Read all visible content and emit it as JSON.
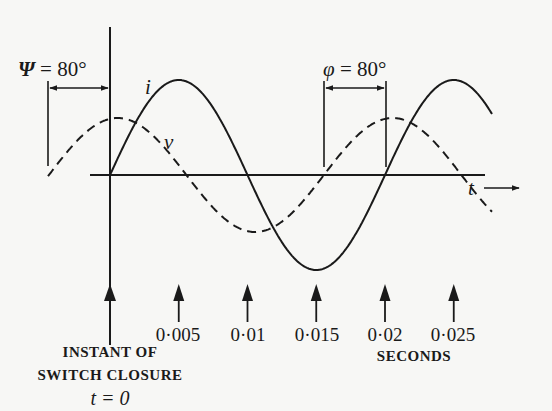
{
  "figure": {
    "psi_label": {
      "symbol": "Ψ",
      "text": " = 80°"
    },
    "phi_label": {
      "symbol": "φ",
      "text": " = 80°"
    },
    "current_label": "i",
    "voltage_label": "v",
    "time_axis_label": "t",
    "origin_caption": [
      "INSTANT OF",
      "SWITCH CLOSURE",
      "t = 0"
    ],
    "time_units": "SECONDS",
    "time_ticks": [
      "0·005",
      "0·01",
      "0·015",
      "0·02",
      "0·025"
    ]
  },
  "chart_data": {
    "type": "line",
    "title": "",
    "xlabel": "t (SECONDS)",
    "ylabel": "",
    "x_ticks": [
      0,
      0.005,
      0.01,
      0.015,
      0.02,
      0.025
    ],
    "x_tick_labels": [
      "0·005",
      "0·01",
      "0·015",
      "0·02",
      "0·025"
    ],
    "xlim": [
      -0.0045,
      0.0265
    ],
    "period_s": 0.02,
    "frequency_hz": 50,
    "series": [
      {
        "name": "i",
        "style": "solid",
        "relative_amplitude": 1.0,
        "phase_deg": 0,
        "description": "current, starts at zero at t=0 (switch closure)",
        "zero_crossings_s": [
          0,
          0.01,
          0.02
        ],
        "peak_s": [
          0.005,
          0.025
        ],
        "trough_s": [
          0.015
        ]
      },
      {
        "name": "v",
        "style": "dashed",
        "relative_amplitude": 0.6,
        "phase_deg": 80,
        "description": "voltage, leads current by 80°",
        "zero_crossings_s": [
          -0.0044,
          0.0056,
          0.0156,
          0.0256
        ],
        "peak_s": [
          0.0006,
          0.0206
        ],
        "trough_s": [
          0.0106
        ]
      }
    ],
    "annotations": [
      {
        "text": "Ψ = 80°",
        "meaning": "switching angle: voltage zero-crossing before t=0 to switch closure"
      },
      {
        "text": "φ = 80°",
        "meaning": "phase angle between v zero-crossing and i zero-crossing"
      },
      {
        "text": "INSTANT OF SWITCH CLOSURE t = 0",
        "position": "below origin arrow"
      }
    ]
  }
}
